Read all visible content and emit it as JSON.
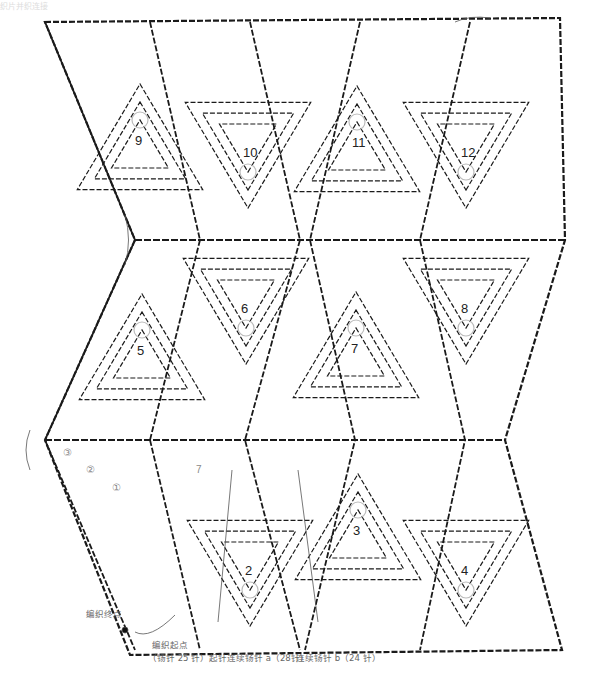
{
  "header_faded_text": "织片并织连接",
  "motifs": [
    {
      "id": "1",
      "label": "",
      "x": 0,
      "y": 0
    },
    {
      "id": "2",
      "label": "2",
      "x": 250,
      "y": 570
    },
    {
      "id": "3",
      "label": "3",
      "x": 358,
      "y": 530
    },
    {
      "id": "4",
      "label": "4",
      "x": 466,
      "y": 570
    },
    {
      "id": "5",
      "label": "5",
      "x": 142,
      "y": 350
    },
    {
      "id": "6",
      "label": "6",
      "x": 246,
      "y": 308
    },
    {
      "id": "7",
      "label": "7",
      "x": 356,
      "y": 348
    },
    {
      "id": "8",
      "label": "8",
      "x": 466,
      "y": 308
    },
    {
      "id": "9",
      "label": "9",
      "x": 140,
      "y": 140
    },
    {
      "id": "10",
      "label": "10",
      "x": 248,
      "y": 152
    },
    {
      "id": "11",
      "label": "11",
      "x": 357,
      "y": 142
    },
    {
      "id": "12",
      "label": "12",
      "x": 466,
      "y": 152
    }
  ],
  "round_markers": [
    {
      "label": "③",
      "x": 63,
      "y": 447
    },
    {
      "label": "②",
      "x": 86,
      "y": 464
    },
    {
      "label": "①",
      "x": 112,
      "y": 482
    },
    {
      "label": "7",
      "x": 196,
      "y": 464
    }
  ],
  "annotations": {
    "end_point": "编织终点",
    "start_point": "编织起点",
    "start_chain": "（钖针 25 针）起针",
    "chain_a": "连续钖针 a（28针）",
    "chain_b": "连续钖针 b（24 针）"
  },
  "colors": {
    "stitch": "#1a1a1a",
    "guide": "#bbbbbb",
    "label": "#666666"
  }
}
